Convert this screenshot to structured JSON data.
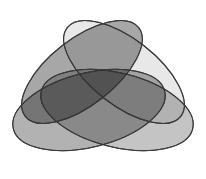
{
  "figure": {
    "kind": "venn-diagram",
    "width": 206,
    "height": 179,
    "background_color": "#ffffff",
    "set_count": 4,
    "region_count": 16,
    "stroke_color": "#3a3a3a",
    "stroke_width": 1,
    "blend_mode": "multiply",
    "has_labels": false,
    "has_legend": false,
    "has_axes": false
  },
  "chart_data": {
    "type": "venn",
    "xlabel": "",
    "ylabel": "",
    "legend": [],
    "annotations": [],
    "grid": false,
    "viewbox": [
      0,
      0,
      206,
      179
    ],
    "sets": [
      {
        "id": "A",
        "name": "ellipse-upper-left",
        "cx": 82,
        "cy": 72,
        "rx": 72,
        "ry": 33,
        "rotation_deg": -38,
        "fill": "#8e8e8e",
        "opacity": 0.78,
        "stroke": "#3a3a3a",
        "tone": "dark-gray"
      },
      {
        "id": "B",
        "name": "ellipse-upper-right",
        "cx": 124,
        "cy": 72,
        "rx": 72,
        "ry": 33,
        "rotation_deg": 38,
        "fill": "#e2e2e2",
        "opacity": 0.78,
        "stroke": "#3a3a3a",
        "tone": "light-gray"
      },
      {
        "id": "C",
        "name": "ellipse-lower-left",
        "cx": 89,
        "cy": 110,
        "rx": 78,
        "ry": 37,
        "rotation_deg": -14,
        "fill": "#9c9c9c",
        "opacity": 0.78,
        "stroke": "#3a3a3a",
        "tone": "medium-dark-gray"
      },
      {
        "id": "D",
        "name": "ellipse-lower-right",
        "cx": 117,
        "cy": 110,
        "rx": 78,
        "ry": 37,
        "rotation_deg": 14,
        "fill": "#b4b4b4",
        "opacity": 0.78,
        "stroke": "#3a3a3a",
        "tone": "medium-gray"
      }
    ],
    "palette": {
      "background": "#ffffff",
      "outline": "#3a3a3a",
      "lightest_region": "#e2e2e2",
      "darkest_region": "#5c5c5c",
      "center_region": "#b9b9b9"
    }
  }
}
